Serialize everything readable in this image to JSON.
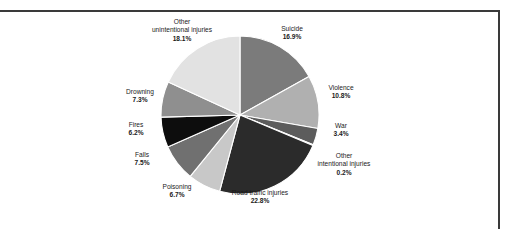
{
  "figure": {
    "background_color": "#ffffff",
    "frame_color": "#3a3a3a"
  },
  "chart_data": {
    "type": "pie",
    "title": "",
    "subtitle": "",
    "xlabel": "",
    "ylabel": "",
    "legend_position": "none",
    "grid": false,
    "start_angle_deg": 0,
    "direction": "clockwise",
    "units": "percent",
    "total": 100.0,
    "categories": [
      "Suicide",
      "Violence",
      "War",
      "Other intentional injuries",
      "Road traffic injuries",
      "Poisoning",
      "Falls",
      "Fires",
      "Drowning",
      "Other unintentional injuries"
    ],
    "values": [
      16.9,
      10.8,
      3.4,
      0.2,
      22.8,
      6.7,
      7.5,
      6.2,
      7.3,
      18.1
    ],
    "colors": [
      "#7b7b7b",
      "#b0b0b0",
      "#5c5c5c",
      "#9a9a9a",
      "#2b2b2b",
      "#c8c8c8",
      "#707070",
      "#0d0d0d",
      "#8f8f8f",
      "#e2e2e2"
    ],
    "slices": [
      {
        "label": "Suicide",
        "value": 16.9,
        "value_label": "16.9%",
        "color": "#7b7b7b"
      },
      {
        "label": "Violence",
        "value": 10.8,
        "value_label": "10.8%",
        "color": "#b0b0b0"
      },
      {
        "label": "War",
        "value": 3.4,
        "value_label": "3.4%",
        "color": "#5c5c5c"
      },
      {
        "label": "Other intentional injuries",
        "value": 0.2,
        "value_label": "0.2%",
        "color": "#9a9a9a"
      },
      {
        "label": "Road traffic injuries",
        "value": 22.8,
        "value_label": "22.8%",
        "color": "#2b2b2b"
      },
      {
        "label": "Poisoning",
        "value": 6.7,
        "value_label": "6.7%",
        "color": "#c8c8c8"
      },
      {
        "label": "Falls",
        "value": 7.5,
        "value_label": "7.5%",
        "color": "#707070"
      },
      {
        "label": "Fires",
        "value": 6.2,
        "value_label": "6.2%",
        "color": "#0d0d0d"
      },
      {
        "label": "Drowning",
        "value": 7.3,
        "value_label": "7.3%",
        "color": "#8f8f8f"
      },
      {
        "label": "Other unintentional injuries",
        "value": 18.1,
        "value_label": "18.1%",
        "color": "#e2e2e2"
      }
    ]
  },
  "labels": {
    "suicide": {
      "name": "Suicide",
      "percent": "16.9%"
    },
    "violence": {
      "name": "Violence",
      "percent": "10.8%"
    },
    "war": {
      "name": "War",
      "percent": "3.4%"
    },
    "other_intentional": {
      "name_line1": "Other",
      "name_line2": "intentional injuries",
      "percent": "0.2%"
    },
    "road_traffic": {
      "name": "Road traffic injuries",
      "percent": "22.8%"
    },
    "poisoning": {
      "name": "Poisoning",
      "percent": "6.7%"
    },
    "falls": {
      "name": "Falls",
      "percent": "7.5%"
    },
    "fires": {
      "name": "Fires",
      "percent": "6.2%"
    },
    "drowning": {
      "name": "Drowning",
      "percent": "7.3%"
    },
    "other_unintentional": {
      "name_line1": "Other",
      "name_line2": "unintentional injuries",
      "percent": "18.1%"
    }
  }
}
